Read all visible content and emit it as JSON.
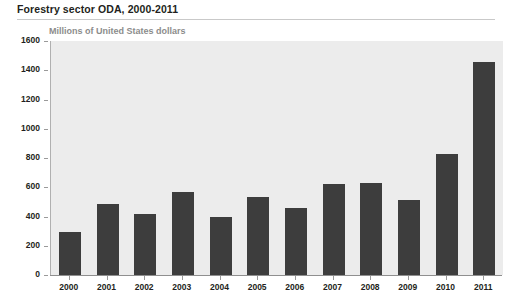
{
  "title": "Forestry sector ODA, 2000-2011",
  "units_label": "Millions of United States dollars",
  "chart_data": {
    "type": "bar",
    "title": "Forestry sector ODA, 2000-2011",
    "subtitle": "Millions of United States dollars",
    "xlabel": "",
    "ylabel": "Millions of United States dollars",
    "ylim": [
      0,
      1600
    ],
    "ytick_step": 200,
    "yticks": [
      0,
      200,
      400,
      600,
      800,
      1000,
      1200,
      1400,
      1600
    ],
    "ytick_labels": [
      "0",
      "200",
      "400",
      "600",
      "800",
      "1000",
      "1200",
      "1400",
      "1600"
    ],
    "grid": false,
    "legend": null,
    "categories": [
      "2000",
      "2001",
      "2002",
      "2003",
      "2004",
      "2005",
      "2006",
      "2007",
      "2008",
      "2009",
      "2010",
      "2011"
    ],
    "values": [
      295,
      485,
      415,
      565,
      400,
      535,
      455,
      620,
      630,
      515,
      825,
      1455
    ],
    "bar_color": "#3d3d3d",
    "plot_background": "#ececec",
    "axis_color": "#8f8f8f",
    "text_color": "#231f20",
    "subtitle_color": "#8c8c8c"
  }
}
